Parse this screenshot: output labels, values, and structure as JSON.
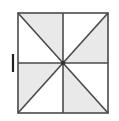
{
  "figure": {
    "type": "geometric-diagram",
    "background_color": "#ffffff",
    "square": {
      "x": 18,
      "y": 13,
      "width": 90,
      "height": 100,
      "stroke_color": "#4a4a4a",
      "stroke_width": 1.6,
      "fill_color": "#ffffff"
    },
    "shaded_fill": "#e9e9e9",
    "unshaded_fill": "#ffffff",
    "line_color": "#4a4a4a",
    "center_dot": {
      "cx": 63,
      "cy": 63,
      "r": 2.1,
      "color": "#2f2f2f"
    },
    "tick_mark": {
      "label": "left-edge-midpoint-tick",
      "x1": 13,
      "y1": 54,
      "x2": 13,
      "y2": 72,
      "color": "#1f1f1f",
      "width": 2.2
    },
    "triangles": [
      {
        "name": "top-left-upper",
        "points": "18,13 63,13 63,63",
        "shaded": true
      },
      {
        "name": "top-left-lower",
        "points": "18,13 63,63 18,63",
        "shaded": false
      },
      {
        "name": "top-right-upper",
        "points": "63,13 108,13 63,63",
        "shaded": false
      },
      {
        "name": "top-right-lower",
        "points": "108,13 108,63 63,63",
        "shaded": true
      },
      {
        "name": "bottom-left-upper",
        "points": "18,63 63,63 18,113",
        "shaded": true
      },
      {
        "name": "bottom-left-lower",
        "points": "63,63 63,113 18,113",
        "shaded": false
      },
      {
        "name": "bottom-right-upper",
        "points": "63,63 108,63 108,113",
        "shaded": false
      },
      {
        "name": "bottom-right-lower",
        "points": "63,63 108,113 63,113",
        "shaded": true
      }
    ],
    "divider_lines": [
      {
        "name": "vertical-midline",
        "x1": 63,
        "y1": 13,
        "x2": 63,
        "y2": 113
      },
      {
        "name": "horizontal-midline",
        "x1": 18,
        "y1": 63,
        "x2": 108,
        "y2": 63
      },
      {
        "name": "main-diagonal",
        "x1": 18,
        "y1": 13,
        "x2": 108,
        "y2": 113
      },
      {
        "name": "anti-diagonal",
        "x1": 108,
        "y1": 13,
        "x2": 18,
        "y2": 113
      }
    ]
  }
}
